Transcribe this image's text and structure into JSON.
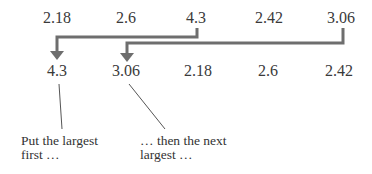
{
  "diagram": {
    "type": "sorting-illustration",
    "original_row": {
      "values": [
        "2.18",
        "2.6",
        "4.3",
        "2.42",
        "3.06"
      ]
    },
    "sorted_row": {
      "values": [
        "4.3",
        "3.06",
        "2.18",
        "2.6",
        "2.42"
      ]
    },
    "arrows": [
      {
        "from_value": "4.3",
        "from_index": 2,
        "to_index": 0
      },
      {
        "from_value": "3.06",
        "from_index": 4,
        "to_index": 1
      }
    ],
    "captions": [
      {
        "text": "Put the largest\nfirst …",
        "points_to_index": 0
      },
      {
        "text": "… then the next\nlargest …",
        "points_to_index": 1
      }
    ],
    "colors": {
      "arrow": "#6e6e6e",
      "text": "#333333",
      "callout_line": "#555555",
      "background": "#ffffff"
    }
  }
}
